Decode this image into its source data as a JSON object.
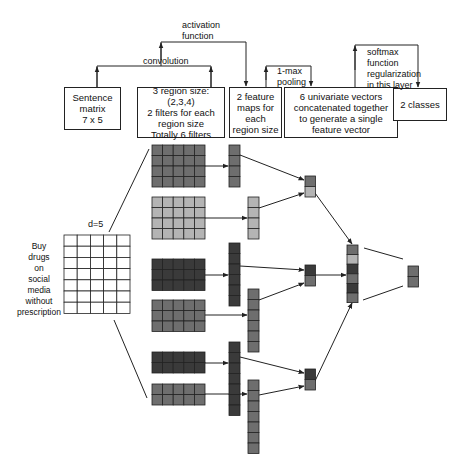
{
  "boxes": {
    "sentence_matrix": "Sentence\nmatrix\n7  x  5",
    "filters": "3 region size: (2,3,4)\n2 filters for each\nregion size\nTotally 6 filters",
    "feature_maps": "2 feature\nmaps for\neach\nregion size",
    "univariate": "6 univariate vectors\nconcatenated together\nto generate a single\nfeature vector",
    "classes": "2 classes"
  },
  "arrow_labels": {
    "convolution": "convolution",
    "activation": "activation\nfunction",
    "pooling": "1-max\npooling",
    "softmax": "softmax\nfunction\nregularization\nin this layer"
  },
  "sentence": {
    "dimension_label": "d=5",
    "words": "Buy\ndrugs\non\nsocial\nmedia\nwithout\nprescription",
    "rows": 7,
    "cols": 5
  },
  "colors": {
    "stroke": "#222222",
    "cell_dark": "#3a3a3a",
    "cell_mid": "#6e6e6e",
    "cell_light": "#b4b4b4",
    "cell_white": "#ffffff"
  },
  "filters": [
    {
      "region_size": 4,
      "shade": "mid",
      "x": 152,
      "y": 145
    },
    {
      "region_size": 4,
      "shade": "light",
      "x": 152,
      "y": 197
    },
    {
      "region_size": 3,
      "shade": "dark",
      "x": 152,
      "y": 259
    },
    {
      "region_size": 3,
      "shade": "mid",
      "x": 152,
      "y": 300
    },
    {
      "region_size": 2,
      "shade": "dark",
      "x": 152,
      "y": 352
    },
    {
      "region_size": 2,
      "shade": "mid",
      "x": 152,
      "y": 384
    }
  ],
  "feature_maps": [
    {
      "length": 4,
      "shade": "mid",
      "x": 229,
      "y": 145
    },
    {
      "length": 4,
      "shade": "light",
      "x": 248,
      "y": 197
    },
    {
      "length": 6,
      "shade": "dark",
      "x": 229,
      "y": 243
    },
    {
      "length": 6,
      "shade": "mid",
      "x": 248,
      "y": 289
    },
    {
      "length": 7,
      "shade": "dark",
      "x": 229,
      "y": 342
    },
    {
      "length": 7,
      "shade": "mid",
      "x": 248,
      "y": 380
    }
  ],
  "pooled": [
    {
      "shades": [
        "mid",
        "light"
      ],
      "x": 305,
      "y": 176
    },
    {
      "shades": [
        "dark",
        "mid"
      ],
      "x": 305,
      "y": 265
    },
    {
      "shades": [
        "dark",
        "mid"
      ],
      "x": 305,
      "y": 369
    }
  ],
  "concatenated": {
    "shades": [
      "mid",
      "light",
      "dark",
      "mid",
      "dark",
      "mid"
    ],
    "x": 347,
    "y": 245
  },
  "output": {
    "shades": [
      "mid",
      "mid"
    ],
    "x": 408,
    "y": 266
  }
}
